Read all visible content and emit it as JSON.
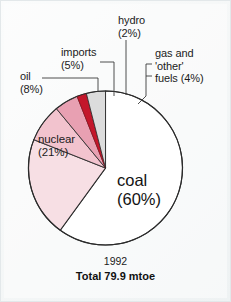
{
  "chart_data": {
    "type": "pie",
    "title": "",
    "subtitle": "",
    "year": "1992",
    "total_label": "Total 79.9 mtoe",
    "total_value": 79.9,
    "total_units": "mtoe",
    "unit": "%",
    "legend_position": "callout-labels",
    "grid": false,
    "start_angle_deg": 0,
    "direction": "counterclockwise-from-top-for-pink-slices",
    "categories": [
      "coal",
      "nuclear",
      "oil",
      "imports",
      "hydro",
      "gas and 'other' fuels"
    ],
    "values": [
      60,
      21,
      8,
      5,
      2,
      4
    ],
    "slices": [
      {
        "name": "coal",
        "label": "coal",
        "percent_label": "(60%)",
        "value": 60,
        "color": "#ffffff",
        "label_placement": "inside"
      },
      {
        "name": "nuclear",
        "label": "nuclear",
        "percent_label": "(21%)",
        "value": 21,
        "color": "#f7dfe4",
        "label_placement": "inside"
      },
      {
        "name": "oil",
        "label": "oil",
        "percent_label": "(8%)",
        "value": 8,
        "color": "#f2c3ce",
        "label_placement": "callout"
      },
      {
        "name": "imports",
        "label": "imports",
        "percent_label": "(5%)",
        "value": 5,
        "color": "#e8a0b2",
        "label_placement": "callout"
      },
      {
        "name": "hydro",
        "label": "hydro",
        "percent_label": "(2%)",
        "value": 2,
        "color": "#c3172b",
        "label_placement": "callout"
      },
      {
        "name": "gas-and-other-fuels",
        "label": "gas and\n'other'",
        "label_line2": "fuels (4%)",
        "percent_label": "(4%)",
        "value": 4,
        "color": "#dcdcdc",
        "label_placement": "callout"
      }
    ],
    "xlabel": "",
    "ylabel": ""
  },
  "labels": {
    "hydro": "hydro\n(2%)",
    "gas_other": "gas and\n'other'\nfuels (4%)",
    "imports": "imports\n(5%)",
    "oil": "oil\n(8%)",
    "nuclear": "nuclear\n(21%)",
    "coal": "coal\n(60%)"
  },
  "caption": {
    "year": "1992",
    "total": "Total 79.9 mtoe"
  },
  "colors": {
    "background": "#f6f8f8",
    "outline": "#2b2b2b",
    "coal": "#ffffff",
    "nuclear": "#f7dfe4",
    "oil": "#f2c3ce",
    "imports": "#e8a0b2",
    "hydro": "#c3172b",
    "gas_other": "#dcdcdc",
    "leader_line": "#3a3a3a",
    "text": "#1b1b1b"
  }
}
